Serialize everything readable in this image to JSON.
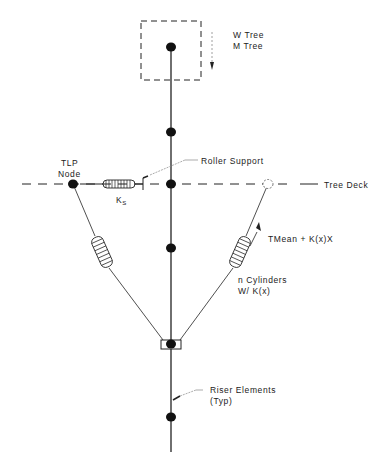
{
  "diagram": {
    "labels": {
      "w_tree": "W Tree",
      "m_tree": "M Tree",
      "tlp_node_1": "TLP",
      "tlp_node_2": "Node",
      "roller_support": "Roller Support",
      "tree_deck": "Tree Deck",
      "ks_main": "K",
      "ks_sub": "S",
      "tension": "TMean + K(x)X",
      "cylinders_1": "n Cylinders",
      "cylinders_2": "W/ K(x)",
      "riser_1": "Riser Elements",
      "riser_2": "(Typ)"
    },
    "colors": {
      "ink": "#222222",
      "leader": "#777777",
      "background": "#ffffff"
    }
  }
}
